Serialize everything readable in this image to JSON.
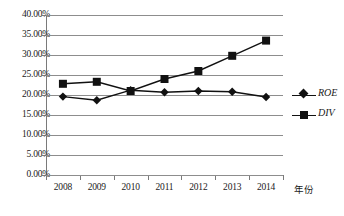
{
  "chart_data": {
    "type": "line",
    "title": "",
    "xlabel": "年份",
    "ylabel": "",
    "categories": [
      "2008",
      "2009",
      "2010",
      "2011",
      "2012",
      "2013",
      "2014"
    ],
    "ylim": [
      0,
      40
    ],
    "ytick_labels": [
      "0.00%",
      "5.00%",
      "10.00%",
      "15.00%",
      "20.00%",
      "25.00%",
      "30.00%",
      "35.00%",
      "40.00%"
    ],
    "ytick_values": [
      0,
      5,
      10,
      15,
      20,
      25,
      30,
      35,
      40
    ],
    "grid": true,
    "legend_position": "right",
    "series": [
      {
        "name": "ROE",
        "marker": "diamond",
        "color": "#111111",
        "values": [
          19.6,
          18.7,
          21.2,
          20.7,
          21.0,
          20.8,
          19.5
        ]
      },
      {
        "name": "DIV",
        "marker": "square",
        "color": "#111111",
        "values": [
          22.8,
          23.3,
          21.0,
          24.0,
          26.0,
          29.8,
          33.6
        ]
      }
    ]
  },
  "legend": {
    "items": [
      {
        "label": "ROE",
        "marker": "diamond"
      },
      {
        "label": "DIV",
        "marker": "square"
      }
    ]
  }
}
